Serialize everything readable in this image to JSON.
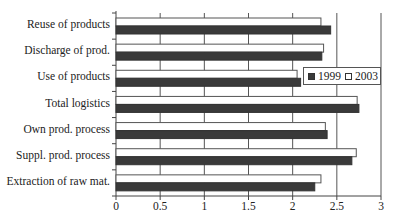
{
  "chart_data": {
    "type": "bar",
    "orientation": "horizontal",
    "title": "",
    "xlabel": "",
    "ylabel": "",
    "categories": [
      "Reuse of products",
      "Discharge of prod.",
      "Use of products",
      "Total logistics",
      "Own prod. process",
      "Suppl. prod. process",
      "Extraction of raw mat."
    ],
    "series": [
      {
        "name": "1999",
        "color": "#3a3a3a",
        "values": [
          2.43,
          2.33,
          2.09,
          2.75,
          2.39,
          2.67,
          2.25
        ]
      },
      {
        "name": "2003",
        "color": "#ffffff",
        "values": [
          2.32,
          2.35,
          2.05,
          2.73,
          2.37,
          2.72,
          2.32
        ]
      }
    ],
    "xlim": [
      0,
      3
    ],
    "xticks": [
      "0",
      "0.5",
      "1",
      "1.5",
      "2",
      "2.5",
      "3"
    ],
    "grid": "vertical",
    "legend": {
      "position": "upper-right-inside",
      "entries": [
        "1999",
        "2003"
      ]
    }
  },
  "legend": {
    "label_1999": "1999",
    "label_2003": "2003"
  }
}
